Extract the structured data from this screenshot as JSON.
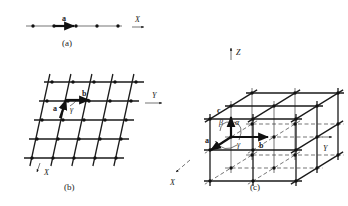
{
  "figure": {
    "panels": [
      {
        "id": "a",
        "caption": "(a)",
        "description": "one-dimensional lattice",
        "vector_labels": [
          "a"
        ],
        "axis_labels": [
          "X"
        ]
      },
      {
        "id": "b",
        "caption": "(b)",
        "description": "two-dimensional lattice",
        "vector_labels": [
          "a",
          "b"
        ],
        "angle_labels": [
          "γ"
        ],
        "axis_labels": [
          "X",
          "Y"
        ],
        "grid": {
          "rows": 5,
          "cols": 5
        }
      },
      {
        "id": "c",
        "caption": "(c)",
        "description": "three-dimensional lattice",
        "vector_labels": [
          "a",
          "b",
          "c"
        ],
        "angle_labels": [
          "α",
          "β",
          "γ"
        ],
        "axis_labels": [
          "X",
          "Y",
          "Z"
        ],
        "grid": {
          "nx": 3,
          "ny": 3,
          "nz": 3
        }
      }
    ]
  }
}
